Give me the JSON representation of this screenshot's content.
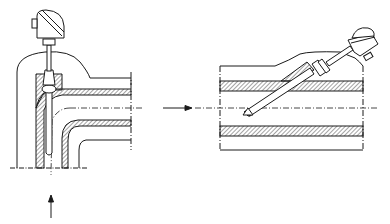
{
  "figure": {
    "type": "technical-drawing",
    "views": [
      {
        "id": "left",
        "description": "Thermowell installed at a pipe elbow, flow from below turning right",
        "flow_directions": [
          "up",
          "right"
        ]
      },
      {
        "id": "right",
        "description": "Thermowell installed at an angle into a straight pipe, flow from left to right",
        "flow_directions": [
          "right"
        ]
      }
    ],
    "colors": {
      "line": "#1a1a1a",
      "hatch": "#333333",
      "background": "#ffffff"
    }
  }
}
